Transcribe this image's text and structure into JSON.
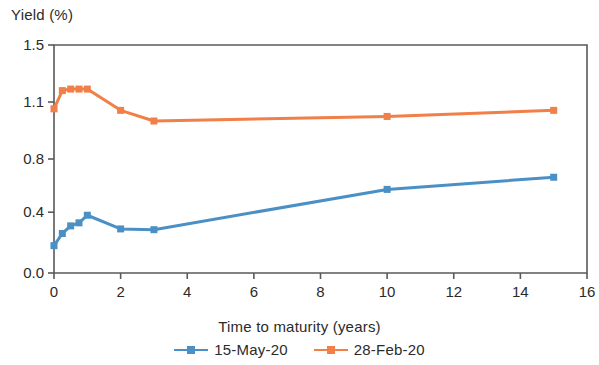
{
  "chart_data": {
    "type": "line",
    "title": "",
    "xlabel": "Time to maturity (years)",
    "ylabel": "Yield (%)",
    "xlim": [
      0,
      16
    ],
    "ylim": [
      0.0,
      1.5
    ],
    "xticks": [
      "0",
      "2",
      "4",
      "6",
      "8",
      "10",
      "12",
      "14",
      "16"
    ],
    "xtick_values": [
      0,
      2,
      4,
      6,
      8,
      10,
      12,
      14,
      16
    ],
    "yticks": [
      "0.0",
      "0.4",
      "0.8",
      "1.1",
      "1.5"
    ],
    "ytick_values": [
      0.0,
      0.4,
      0.75,
      1.125,
      1.5
    ],
    "grid": false,
    "legend_position": "bottom",
    "series": [
      {
        "name": "15-May-20",
        "color": "#4a90c4",
        "marker": "square",
        "x": [
          0,
          0.25,
          0.5,
          0.75,
          1.0,
          2.0,
          3.0,
          10.0,
          15.0
        ],
        "y": [
          0.18,
          0.26,
          0.31,
          0.33,
          0.38,
          0.29,
          0.285,
          0.55,
          0.63
        ]
      },
      {
        "name": "28-Feb-20",
        "color": "#f07f48",
        "marker": "square",
        "x": [
          0,
          0.25,
          0.5,
          0.75,
          1.0,
          2.0,
          3.0,
          10.0,
          15.0
        ],
        "y": [
          1.08,
          1.2,
          1.21,
          1.21,
          1.21,
          1.07,
          1.0,
          1.03,
          1.07
        ]
      }
    ]
  },
  "axis_titles": {
    "y": "Yield (%)",
    "x": "Time to maturity (years)"
  },
  "legend": {
    "items": [
      {
        "label": "15-May-20",
        "color": "#4a90c4"
      },
      {
        "label": "28-Feb-20",
        "color": "#f07f48"
      }
    ]
  },
  "colors": {
    "series_blue": "#4a90c4",
    "series_orange": "#f07f48",
    "axis": "#58595b",
    "text": "#2b2b2b",
    "background": "#ffffff"
  }
}
